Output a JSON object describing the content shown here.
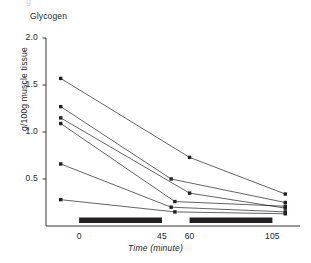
{
  "figure": {
    "cut_off_top_text": "g",
    "corner_label": "Glycogen",
    "ylabel": "g/100g muscle tissue",
    "xlabel": "Time (minute)",
    "line_color": "#231f20",
    "marker_color": "#231f20",
    "bar_color": "#231f20",
    "axis_color": "#231f20",
    "background": "#ffffff"
  },
  "chart_data": {
    "type": "line",
    "title": "Glycogen",
    "xlabel": "Time (minute)",
    "ylabel": "g/100g muscle tissue",
    "xlim": [
      -18,
      120
    ],
    "ylim": [
      0,
      2.0
    ],
    "grid": false,
    "legend": false,
    "yticks": [
      0.5,
      1.0,
      1.5,
      2.0
    ],
    "ytick_labels": [
      "0.5",
      "1.0",
      "1.5",
      "2.0"
    ],
    "xticks": [
      0,
      45,
      60,
      105
    ],
    "xtick_labels": [
      "0",
      "45",
      "60",
      "105"
    ],
    "marker": "square",
    "exercise_bars": [
      {
        "start": 0,
        "end": 45
      },
      {
        "start": 60,
        "end": 105
      }
    ],
    "series": [
      {
        "name": "subject-1",
        "x": [
          -10,
          60,
          112
        ],
        "values": [
          1.57,
          0.73,
          0.34
        ]
      },
      {
        "name": "subject-2",
        "x": [
          -10,
          50,
          112
        ],
        "values": [
          1.27,
          0.5,
          0.25
        ]
      },
      {
        "name": "subject-3",
        "x": [
          -10,
          60,
          112
        ],
        "values": [
          1.15,
          0.35,
          0.19
        ]
      },
      {
        "name": "subject-4",
        "x": [
          -10,
          52,
          112
        ],
        "values": [
          1.09,
          0.26,
          0.21
        ]
      },
      {
        "name": "subject-5",
        "x": [
          -10,
          50,
          112
        ],
        "values": [
          0.66,
          0.2,
          0.15
        ]
      },
      {
        "name": "subject-6",
        "x": [
          -10,
          52,
          112
        ],
        "values": [
          0.28,
          0.15,
          0.13
        ]
      }
    ]
  }
}
